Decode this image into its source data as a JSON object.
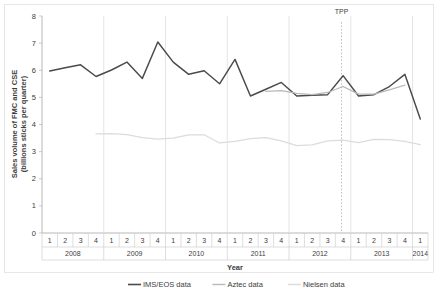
{
  "chart_data": {
    "type": "line",
    "title": "",
    "xlabel": "Year",
    "ylabel": "Sales volume of FMC and CSE (billions sticks per quarter)",
    "ylabel_line1": "Sales volume of FMC and CSE",
    "ylabel_line2": "(billions sticks per quarter)",
    "ylim": [
      0,
      8
    ],
    "yticks": [
      "0",
      "1",
      "2",
      "3",
      "4",
      "5",
      "6",
      "7",
      "8"
    ],
    "grid": false,
    "legend_position": "bottom",
    "x": [
      "2008 Q1",
      "2008 Q2",
      "2008 Q3",
      "2008 Q4",
      "2009 Q1",
      "2009 Q2",
      "2009 Q3",
      "2009 Q4",
      "2010 Q1",
      "2010 Q2",
      "2010 Q3",
      "2010 Q4",
      "2011 Q1",
      "2011 Q2",
      "2011 Q3",
      "2011 Q4",
      "2012 Q1",
      "2012 Q2",
      "2012 Q3",
      "2012 Q4",
      "2013 Q1",
      "2013 Q2",
      "2013 Q3",
      "2013 Q4",
      "2014 Q1"
    ],
    "quarter_labels": [
      "1",
      "2",
      "3",
      "4",
      "1",
      "2",
      "3",
      "4",
      "1",
      "2",
      "3",
      "4",
      "1",
      "2",
      "3",
      "4",
      "1",
      "2",
      "3",
      "4",
      "1",
      "2",
      "3",
      "4",
      "1"
    ],
    "year_groups": [
      {
        "label": "2008",
        "quarters": 4
      },
      {
        "label": "2009",
        "quarters": 4
      },
      {
        "label": "2010",
        "quarters": 4
      },
      {
        "label": "2011",
        "quarters": 4
      },
      {
        "label": "2012",
        "quarters": 4
      },
      {
        "label": "2013",
        "quarters": 4
      },
      {
        "label": "2014",
        "quarters": 1
      }
    ],
    "series": [
      {
        "name": "IMS/EOS data",
        "color": "#4a4a4a",
        "start_index": 0,
        "values": [
          5.97,
          6.09,
          6.2,
          5.77,
          6.01,
          6.3,
          5.7,
          7.04,
          6.3,
          5.85,
          5.98,
          5.5,
          6.4,
          5.05,
          5.3,
          5.55,
          5.05,
          5.08,
          5.1,
          5.8,
          5.05,
          5.1,
          5.4,
          5.85,
          4.2
        ]
      },
      {
        "name": "Aztec data",
        "color": "#b9b9b9",
        "start_index": 14,
        "values": [
          null,
          null,
          null,
          null,
          null,
          null,
          null,
          null,
          null,
          null,
          null,
          null,
          null,
          null,
          5.22,
          5.25,
          5.15,
          5.1,
          5.18,
          5.4,
          5.12,
          5.12,
          5.28,
          5.45,
          null
        ]
      },
      {
        "name": "Nielsen data",
        "color": "#dcdcdc",
        "start_index": 3,
        "values": [
          null,
          null,
          null,
          3.65,
          3.66,
          3.63,
          3.52,
          3.46,
          3.5,
          3.62,
          3.62,
          3.32,
          3.38,
          3.48,
          3.52,
          3.4,
          3.22,
          3.25,
          3.4,
          3.42,
          3.33,
          3.45,
          3.44,
          3.38,
          3.26
        ]
      }
    ],
    "annotations": [
      {
        "label": "TPP",
        "x_index": 19.4,
        "type": "vertical-dotted-line"
      }
    ]
  },
  "legend": {
    "items": [
      {
        "label": "IMS/EOS data",
        "color": "#4a4a4a"
      },
      {
        "label": "Aztec data",
        "color": "#b9b9b9"
      },
      {
        "label": "Nielsen data",
        "color": "#dcdcdc"
      }
    ]
  }
}
